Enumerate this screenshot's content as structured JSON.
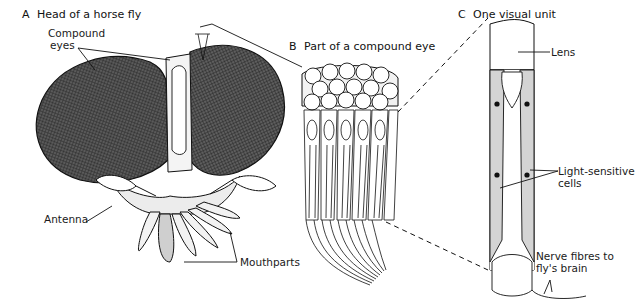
{
  "panels": {
    "a": {
      "letter": "A",
      "title": "Head of a horse fly"
    },
    "b": {
      "letter": "B",
      "title": "Part of a compound eye"
    },
    "c": {
      "letter": "C",
      "title": "One visual unit"
    }
  },
  "labels": {
    "compound_eyes_line1": "Compound",
    "compound_eyes_line2": "eyes",
    "antenna": "Antenna",
    "mouthparts": "Mouthparts",
    "lens": "Lens",
    "light_sensitive_line1": "Light-sensitive",
    "light_sensitive_line2": "cells",
    "nerve_line1": "Nerve fibres to",
    "nerve_line2": "fly's brain"
  },
  "colors": {
    "ink": "#1a1a1a",
    "shading": "#d4d4d4",
    "background": "#ffffff"
  }
}
